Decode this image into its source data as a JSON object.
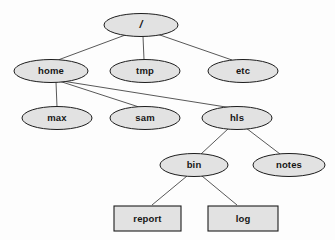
{
  "diagram": {
    "type": "tree",
    "background_color": "#fdfdfd",
    "node_fill_color": "#e2e2e2",
    "node_border_color": "#1d1d1d",
    "edge_color": "#3a3a3a",
    "nodes": [
      {
        "id": "root",
        "label": "/",
        "shape": "ellipse",
        "kind": "directory",
        "cx": 141,
        "cy": 25,
        "rx": 37,
        "ry": 11.5,
        "level": 0
      },
      {
        "id": "home",
        "label": "home",
        "shape": "ellipse",
        "kind": "directory",
        "cx": 51,
        "cy": 71,
        "rx": 37,
        "ry": 11.5,
        "level": 1
      },
      {
        "id": "tmp",
        "label": "tmp",
        "shape": "ellipse",
        "kind": "directory",
        "cx": 145,
        "cy": 71,
        "rx": 35,
        "ry": 11.5,
        "level": 1
      },
      {
        "id": "etc",
        "label": "etc",
        "shape": "ellipse",
        "kind": "directory",
        "cx": 243,
        "cy": 71,
        "rx": 35,
        "ry": 11.5,
        "level": 1
      },
      {
        "id": "max",
        "label": "max",
        "shape": "ellipse",
        "kind": "directory",
        "cx": 57,
        "cy": 118,
        "rx": 35,
        "ry": 11.5,
        "level": 2
      },
      {
        "id": "sam",
        "label": "sam",
        "shape": "ellipse",
        "kind": "directory",
        "cx": 145,
        "cy": 118,
        "rx": 35,
        "ry": 11.5,
        "level": 2
      },
      {
        "id": "hls",
        "label": "hls",
        "shape": "ellipse",
        "kind": "directory",
        "cx": 237,
        "cy": 118,
        "rx": 35,
        "ry": 11.5,
        "level": 2
      },
      {
        "id": "bin",
        "label": "bin",
        "shape": "ellipse",
        "kind": "directory",
        "cx": 194,
        "cy": 165,
        "rx": 34,
        "ry": 11.5,
        "level": 3
      },
      {
        "id": "notes",
        "label": "notes",
        "shape": "ellipse",
        "kind": "directory",
        "cx": 289,
        "cy": 165,
        "rx": 36,
        "ry": 11.5,
        "level": 3
      },
      {
        "id": "report",
        "label": "report",
        "shape": "rectangle",
        "kind": "file",
        "x": 114,
        "y": 206,
        "width": 67,
        "height": 25,
        "level": 4
      },
      {
        "id": "log",
        "label": "log",
        "shape": "rectangle",
        "kind": "file",
        "x": 208,
        "y": 206,
        "width": 70,
        "height": 25,
        "level": 4
      }
    ],
    "edges": [
      {
        "from": "root",
        "to": "home"
      },
      {
        "from": "root",
        "to": "tmp"
      },
      {
        "from": "root",
        "to": "etc"
      },
      {
        "from": "home",
        "to": "max"
      },
      {
        "from": "home",
        "to": "sam"
      },
      {
        "from": "home",
        "to": "hls"
      },
      {
        "from": "hls",
        "to": "bin"
      },
      {
        "from": "hls",
        "to": "notes"
      },
      {
        "from": "bin",
        "to": "report"
      },
      {
        "from": "bin",
        "to": "log"
      }
    ],
    "ghost_text": "ghost bleed-through text"
  }
}
